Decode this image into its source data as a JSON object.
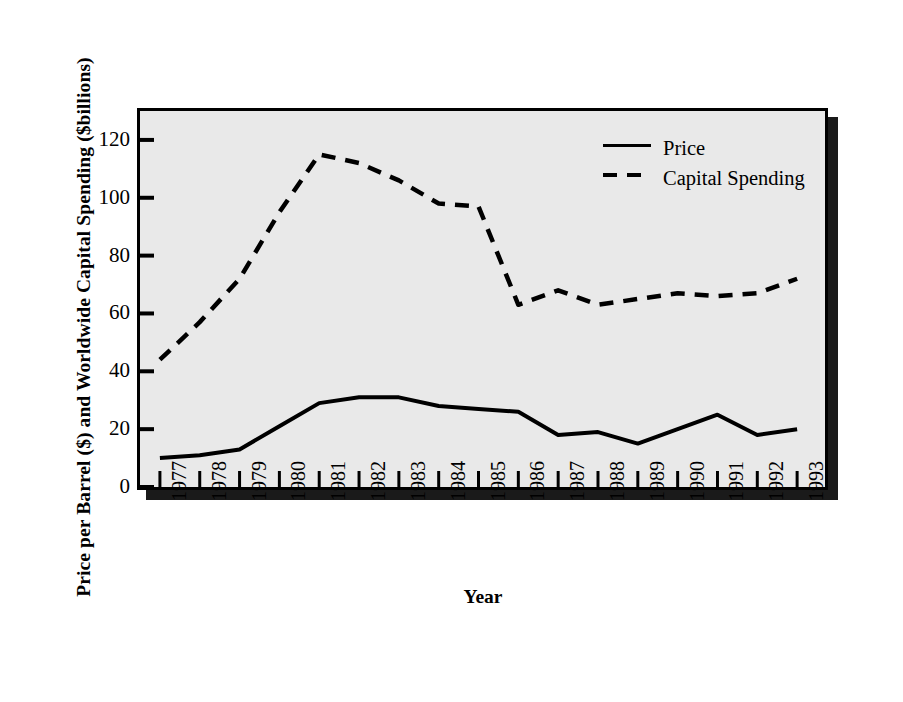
{
  "chart_data": {
    "type": "line",
    "title": "",
    "xlabel": "Year",
    "ylabel": "Price per Barrel ($) and Worldwide Capital Spending ($billions)",
    "categories": [
      "1977",
      "1978",
      "1979",
      "1980",
      "1981",
      "1982",
      "1983",
      "1984",
      "1985",
      "1986",
      "1987",
      "1988",
      "1989",
      "1990",
      "1991",
      "1992",
      "1993"
    ],
    "x": [
      1977,
      1978,
      1979,
      1980,
      1981,
      1982,
      1983,
      1984,
      1985,
      1986,
      1987,
      1988,
      1989,
      1990,
      1991,
      1992,
      1993
    ],
    "series": [
      {
        "name": "Price",
        "style": "solid",
        "color": "#000000",
        "values": [
          10,
          11,
          13,
          21,
          29,
          31,
          31,
          28,
          27,
          26,
          18,
          19,
          15,
          20,
          25,
          18,
          20
        ]
      },
      {
        "name": "Capital Spending",
        "style": "dashed",
        "color": "#000000",
        "values": [
          44,
          57,
          72,
          95,
          115,
          112,
          106,
          98,
          97,
          63,
          68,
          63,
          65,
          67,
          66,
          67,
          72
        ]
      }
    ],
    "ylim": [
      0,
      130
    ],
    "xlim": [
      1976.5,
      1993.7
    ],
    "yticks": [
      0,
      20,
      40,
      60,
      80,
      100,
      120
    ],
    "ytick_labels": [
      "0",
      "20",
      "40",
      "60",
      "80",
      "100",
      "120"
    ],
    "xticks": [
      1977,
      1978,
      1979,
      1980,
      1981,
      1982,
      1983,
      1984,
      1985,
      1986,
      1987,
      1988,
      1989,
      1990,
      1991,
      1992,
      1993
    ],
    "grid": false,
    "legend_position": "upper right",
    "legend_entries": [
      "Price",
      "Capital Spending"
    ],
    "plot_background": "#e9e9e9",
    "frame_color": "#000000"
  }
}
